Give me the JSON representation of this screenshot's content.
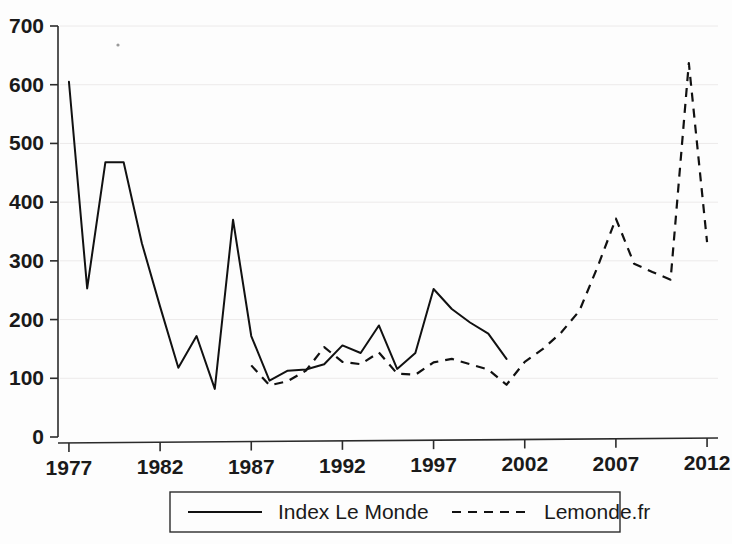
{
  "chart_data": {
    "type": "line",
    "title": "",
    "subtitle": "",
    "xlabel": "",
    "ylabel": "",
    "xlim": [
      1976.4,
      2012.6
    ],
    "ylim": [
      0,
      700
    ],
    "grid": true,
    "grid_axis": "y",
    "legend_position": "bottom-center",
    "x_ticks": [
      1977,
      1982,
      1987,
      1992,
      1997,
      2002,
      2007,
      2012
    ],
    "x_tick_labels": [
      "1977",
      "1982",
      "1987",
      "1992",
      "1997",
      "2002",
      "2007",
      "2012"
    ],
    "y_ticks": [
      0,
      100,
      200,
      300,
      400,
      500,
      600,
      700
    ],
    "y_tick_labels": [
      "0",
      "100",
      "200",
      "300",
      "400",
      "500",
      "600",
      "700"
    ],
    "series": [
      {
        "name": "Index Le Monde",
        "style": "solid",
        "color": "#111111",
        "x": [
          1977,
          1978,
          1979,
          1980,
          1981,
          1982,
          1983,
          1984,
          1985,
          1986,
          1987,
          1988,
          1989,
          1990,
          1991,
          1992,
          1993,
          1994,
          1995,
          1996,
          1997,
          1998,
          1999,
          2000,
          2001
        ],
        "values": [
          605,
          253,
          468,
          468,
          330,
          222,
          118,
          172,
          82,
          370,
          172,
          96,
          113,
          115,
          124,
          156,
          143,
          190,
          116,
          143,
          252,
          218,
          195,
          176,
          133
        ]
      },
      {
        "name": "Lemonde.fr",
        "style": "dashed",
        "color": "#111111",
        "x": [
          1987,
          1988,
          1989,
          1990,
          1991,
          1992,
          1993,
          1994,
          1995,
          1996,
          1997,
          1998,
          1999,
          2000,
          2001,
          2002,
          2003,
          2004,
          2005,
          2006,
          2007,
          2008,
          2009,
          2010,
          2011,
          2012
        ],
        "values": [
          122,
          88,
          95,
          113,
          153,
          128,
          124,
          144,
          108,
          106,
          127,
          133,
          124,
          115,
          89,
          128,
          150,
          178,
          215,
          290,
          372,
          295,
          281,
          268,
          637,
          332
        ]
      }
    ]
  },
  "legend": {
    "entries": [
      {
        "label": "Index Le Monde",
        "style": "solid"
      },
      {
        "label": "Lemonde.fr",
        "style": "dashed"
      }
    ]
  },
  "axes": {
    "y_labels": [
      "700",
      "600",
      "500",
      "400",
      "300",
      "200",
      "100",
      "0"
    ],
    "x_labels": [
      "1977",
      "1982",
      "1987",
      "1992",
      "1997",
      "2002",
      "2007",
      "2012"
    ]
  }
}
